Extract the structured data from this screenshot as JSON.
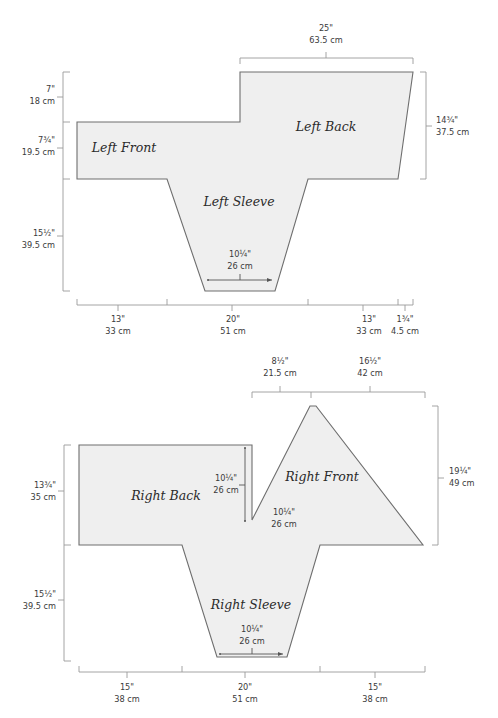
{
  "diagrams": [
    {
      "id": "left-side",
      "pieces": {
        "left_front": "Left Front",
        "left_back": "Left Back",
        "left_sleeve": "Left Sleeve"
      },
      "dimensions": {
        "top_width": {
          "in": "25\"",
          "cm": "63.5 cm"
        },
        "right_height": {
          "in": "14¾\"",
          "cm": "37.5 cm"
        },
        "left_upper": {
          "in": "7\"",
          "cm": "18 cm"
        },
        "left_middle": {
          "in": "7¾\"",
          "cm": "19.5 cm"
        },
        "left_lower": {
          "in": "15½\"",
          "cm": "39.5 cm"
        },
        "sleeve_cuff": {
          "in": "10¼\"",
          "cm": "26 cm"
        },
        "bottom_1": {
          "in": "13\"",
          "cm": "33 cm"
        },
        "bottom_2": {
          "in": "20\"",
          "cm": "51 cm"
        },
        "bottom_3": {
          "in": "13\"",
          "cm": "33 cm"
        },
        "bottom_4": {
          "in": "1¾\"",
          "cm": "4.5 cm"
        }
      }
    },
    {
      "id": "right-side",
      "pieces": {
        "right_back": "Right Back",
        "right_front": "Right Front",
        "right_sleeve": "Right Sleeve"
      },
      "dimensions": {
        "top_1": {
          "in": "8½\"",
          "cm": "21.5 cm"
        },
        "top_2": {
          "in": "16½\"",
          "cm": "42 cm"
        },
        "right_height": {
          "in": "19¼\"",
          "cm": "49 cm"
        },
        "left_upper": {
          "in": "13¾\"",
          "cm": "35 cm"
        },
        "left_lower": {
          "in": "15½\"",
          "cm": "39.5 cm"
        },
        "neck_depth": {
          "in": "10¼\"",
          "cm": "26 cm"
        },
        "neck_width": {
          "in": "10¼\"",
          "cm": "26 cm"
        },
        "sleeve_cuff": {
          "in": "10¼\"",
          "cm": "26 cm"
        },
        "bottom_1": {
          "in": "15\"",
          "cm": "38 cm"
        },
        "bottom_2": {
          "in": "20\"",
          "cm": "51 cm"
        },
        "bottom_3": {
          "in": "15\"",
          "cm": "38 cm"
        }
      }
    }
  ],
  "colors": {
    "piece_fill": "#efefef",
    "piece_stroke": "#6e6e6e",
    "dimension_line": "#9a9a9a",
    "text": "#3a3a3a"
  }
}
